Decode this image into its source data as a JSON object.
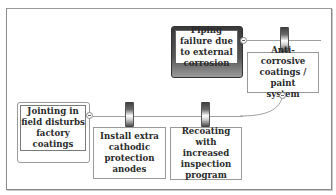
{
  "diagram": {
    "type": "bowtie-threat-leg",
    "top_event": {
      "label": "Piping failure due to external corrosion",
      "lines": [
        "Piping failure",
        "due to external",
        "corrosion"
      ]
    },
    "threat": {
      "label": "Jointing in field disturbs factory coatings",
      "lines": [
        "Jointing in",
        "field disturbs",
        "factory",
        "coatings"
      ]
    },
    "barriers": [
      {
        "id": "barrier-1",
        "label": "Anti-corrosive coatings / paint system",
        "lines": [
          "Anti-corrosive",
          "coatings / paint",
          "system"
        ]
      },
      {
        "id": "barrier-2",
        "label": "Install extra cathodic protection anodes",
        "lines": [
          "Install extra",
          "cathodic",
          "protection",
          "anodes"
        ]
      },
      {
        "id": "barrier-3",
        "label": "Recoating with increased inspection program",
        "lines": [
          "Recoating with",
          "increased",
          "inspection",
          "program"
        ]
      }
    ],
    "icons": {
      "collapse": "minus-circle-icon",
      "barrier": "barrier-bar-icon"
    },
    "colors": {
      "line": "#a0a0a0",
      "border": "#9a9a9a",
      "top_event_dark": "#3a3a3a",
      "text": "#2a2a2a"
    }
  }
}
